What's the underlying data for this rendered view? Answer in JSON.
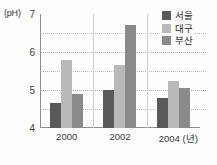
{
  "chart_data": {
    "type": "bar",
    "title": "",
    "subtitle": "",
    "xlabel": "년",
    "ylabel": "(pH)",
    "y_unit_label": "(pH)",
    "categories": [
      "2000",
      "2002",
      "2004"
    ],
    "x_tick_labels": [
      "2000",
      "2002",
      "2004 (년)"
    ],
    "ylim": [
      4,
      7
    ],
    "y_ticks": [
      4,
      5,
      6,
      7
    ],
    "y_tick_labels": [
      "4",
      "5",
      "6",
      "7"
    ],
    "gridlines": [
      4.5,
      5,
      5.5,
      6,
      6.5
    ],
    "grid": true,
    "legend_position": "top-right",
    "series": [
      {
        "name": "서울",
        "color": "#595959",
        "values": [
          4.65,
          5.0,
          4.8
        ]
      },
      {
        "name": "대구",
        "color": "#b9b9b9",
        "values": [
          5.8,
          5.65,
          5.25
        ]
      },
      {
        "name": "부산",
        "color": "#8a8a8a",
        "values": [
          4.9,
          6.7,
          5.05
        ]
      }
    ]
  },
  "legend": {
    "items": [
      {
        "label": "서울",
        "color": "#595959"
      },
      {
        "label": "대구",
        "color": "#b9b9b9"
      },
      {
        "label": "부산",
        "color": "#8a8a8a"
      }
    ]
  },
  "axes": {
    "unit_label": "(pH)",
    "y_tick_labels": [
      "7",
      "6",
      "5",
      "4"
    ],
    "x_tick_labels": [
      "2000",
      "2002",
      "2004 (년)"
    ]
  }
}
